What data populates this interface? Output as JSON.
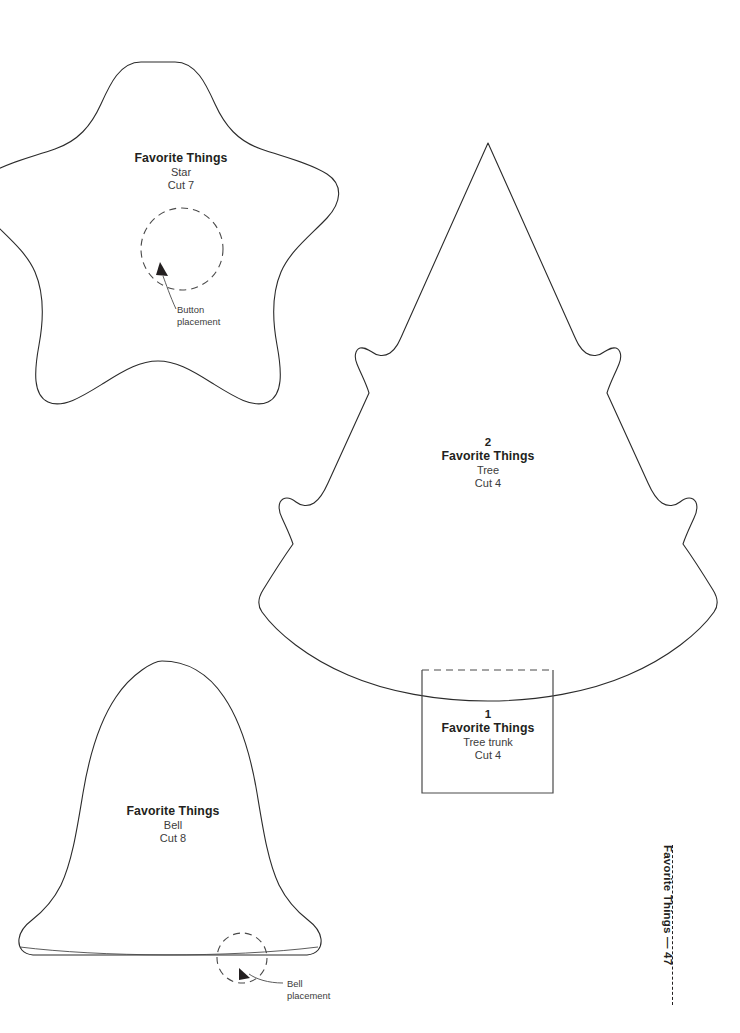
{
  "page": {
    "kind": "sewing-pattern-template-sheet",
    "background_color": "#ffffff",
    "ink_color": "#231f20",
    "footer": {
      "book_title": "Favorite Things",
      "separator": "—",
      "page_number": "47",
      "combined": "Favorite Things — 47"
    }
  },
  "patterns": [
    {
      "id": "star",
      "shape": "five-point-rounded-star",
      "number": "",
      "title": "Favorite Things",
      "piece": "Star",
      "cut": "Cut 7",
      "guide": {
        "type": "dashed-circle",
        "label_line_1": "Button",
        "label_line_2": "placement"
      }
    },
    {
      "id": "tree",
      "shape": "christmas-tree",
      "number": "2",
      "title": "Favorite Things",
      "piece": "Tree",
      "cut": "Cut 4"
    },
    {
      "id": "tree-trunk",
      "shape": "rectangle-dashed-top",
      "number": "1",
      "title": "Favorite Things",
      "piece": "Tree trunk",
      "cut": "Cut 4"
    },
    {
      "id": "bell",
      "shape": "bell",
      "number": "",
      "title": "Favorite Things",
      "piece": "Bell",
      "cut": "Cut 8",
      "guide": {
        "type": "dashed-circle",
        "label_line_1": "Bell",
        "label_line_2": "placement"
      }
    }
  ]
}
